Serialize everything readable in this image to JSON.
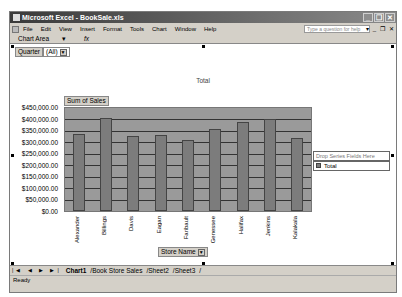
{
  "window": {
    "title": "Microsoft Excel - BookSale.xls",
    "buttons": [
      "minimize",
      "restore",
      "close"
    ]
  },
  "menubar": {
    "items": [
      "File",
      "Edit",
      "View",
      "Insert",
      "Format",
      "Tools",
      "Chart",
      "Window",
      "Help"
    ],
    "help_placeholder": "Type a question for help"
  },
  "toolbar": {
    "name_box": "Chart Area",
    "fx": "fx"
  },
  "pivot": {
    "page_field_label": "Quarter",
    "page_field_value": "(All)",
    "data_field": "Sum of Sales",
    "category_field": "Store Name",
    "series_drop_zone": "Drop Series Fields Here"
  },
  "chart_data": {
    "type": "bar",
    "title": "Total",
    "xlabel": "Store Name",
    "ylabel": "Sum of Sales",
    "categories": [
      "Alexander",
      "Billings",
      "Davis",
      "Eagan",
      "Faribault",
      "Genessee",
      "Halifax",
      "Jenkins",
      "Kalakala"
    ],
    "series": [
      {
        "name": "Total",
        "values": [
          335000,
          408000,
          328000,
          332000,
          310000,
          357000,
          387000,
          404000,
          318000
        ]
      }
    ],
    "yticks": [
      "$450,000.00",
      "$400,000.00",
      "$350,000.00",
      "$300,000.00",
      "$250,000.00",
      "$200,000.00",
      "$150,000.00",
      "$100,000.00",
      "$50,000.00",
      "$0.00"
    ],
    "ylim": [
      0,
      450000
    ],
    "grid": true,
    "legend_position": "right",
    "colors": {
      "bar": "#7c7c7c",
      "plot_bg": "#9a9a9a"
    }
  },
  "legend": {
    "entries": [
      "Total"
    ]
  },
  "sheet_tabs": [
    "Chart1",
    "Book Store Sales",
    "Sheet2",
    "Sheet3"
  ],
  "active_tab": "Chart1",
  "status": "Ready"
}
